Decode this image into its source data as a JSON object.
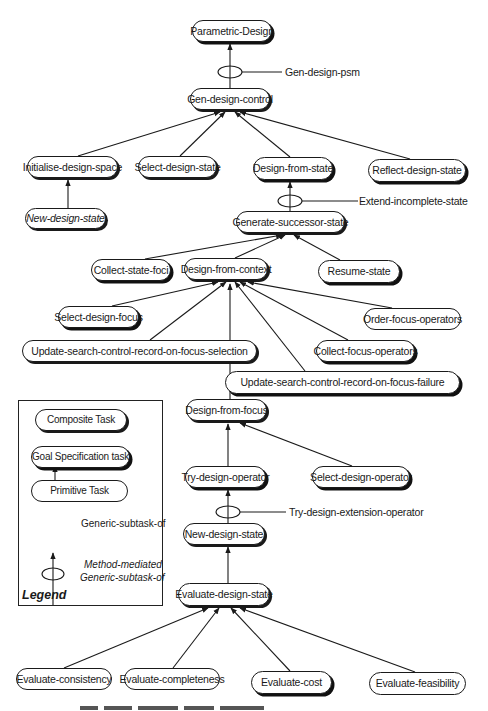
{
  "diagram": {
    "type": "task-decomposition-hierarchy",
    "nodes": {
      "parametric_design": {
        "label": "Parametric-Design",
        "kind": "goal"
      },
      "gen_design_control": {
        "label": "Gen-design-control",
        "kind": "composite"
      },
      "initialise_design_space": {
        "label": "Initialise-design-space",
        "kind": "composite"
      },
      "select_design_state": {
        "label": "Select-design-state",
        "kind": "composite"
      },
      "design_from_state": {
        "label": "Design-from-state",
        "kind": "goal"
      },
      "reflect_design_state": {
        "label": "Reflect-design-state",
        "kind": "goal"
      },
      "new_design_state_italic": {
        "label": "New-design-state",
        "kind": "composite",
        "italic": true
      },
      "generate_successor_state": {
        "label": "Generate-successor-state",
        "kind": "composite"
      },
      "collect_state_foci": {
        "label": "Collect-state-foci",
        "kind": "goal"
      },
      "design_from_context": {
        "label": "Design-from-context",
        "kind": "composite"
      },
      "resume_state": {
        "label": "Resume-state",
        "kind": "goal"
      },
      "select_design_focus": {
        "label": "Select-design-focus",
        "kind": "goal"
      },
      "order_focus_operators": {
        "label": "Order-focus-operators",
        "kind": "primitive"
      },
      "update_on_focus_selection": {
        "label": "Update-search-control-record-on-focus-selection",
        "kind": "composite"
      },
      "collect_focus_operators": {
        "label": "Collect-focus-operators",
        "kind": "goal"
      },
      "update_on_focus_failure": {
        "label": "Update-search-control-record-on-focus-failure",
        "kind": "goal"
      },
      "design_from_focus": {
        "label": "Design-from-focus",
        "kind": "composite"
      },
      "try_design_operator": {
        "label": "Try-design-operator",
        "kind": "goal"
      },
      "select_design_operator": {
        "label": "Select-design-operator",
        "kind": "goal"
      },
      "new_design_state": {
        "label": "New-design-state",
        "kind": "composite"
      },
      "evaluate_design_state": {
        "label": "Evaluate-design-state",
        "kind": "composite"
      },
      "evaluate_consistency": {
        "label": "Evaluate-consistency",
        "kind": "primitive"
      },
      "evaluate_completeness": {
        "label": "Evaluate-completeness",
        "kind": "primitive"
      },
      "evaluate_cost": {
        "label": "Evaluate-cost",
        "kind": "goal"
      },
      "evaluate_feasibility": {
        "label": "Evaluate-feasibility",
        "kind": "primitive"
      }
    },
    "methods": {
      "gen_design_psm": {
        "label": "Gen-design-psm"
      },
      "extend_incomplete_state": {
        "label": "Extend-incomplete-state"
      },
      "try_design_extension_operator": {
        "label": "Try-design-extension-operator"
      }
    },
    "edges": [
      {
        "from": "gen_design_control",
        "to": "parametric_design",
        "via": "Gen-design-psm"
      },
      {
        "from": "initialise_design_space",
        "to": "gen_design_control"
      },
      {
        "from": "select_design_state",
        "to": "gen_design_control"
      },
      {
        "from": "design_from_state",
        "to": "gen_design_control"
      },
      {
        "from": "reflect_design_state",
        "to": "gen_design_control"
      },
      {
        "from": "new_design_state_italic",
        "to": "initialise_design_space"
      },
      {
        "from": "generate_successor_state",
        "to": "design_from_state",
        "via": "Extend-incomplete-state"
      },
      {
        "from": "collect_state_foci",
        "to": "generate_successor_state"
      },
      {
        "from": "design_from_context",
        "to": "generate_successor_state"
      },
      {
        "from": "resume_state",
        "to": "generate_successor_state"
      },
      {
        "from": "select_design_focus",
        "to": "design_from_context"
      },
      {
        "from": "update_on_focus_selection",
        "to": "design_from_context"
      },
      {
        "from": "design_from_focus",
        "to": "design_from_context"
      },
      {
        "from": "update_on_focus_failure",
        "to": "design_from_context"
      },
      {
        "from": "collect_focus_operators",
        "to": "design_from_context"
      },
      {
        "from": "order_focus_operators",
        "to": "design_from_context"
      },
      {
        "from": "try_design_operator",
        "to": "design_from_focus"
      },
      {
        "from": "select_design_operator",
        "to": "design_from_focus"
      },
      {
        "from": "new_design_state",
        "to": "try_design_operator",
        "via": "Try-design-extension-operator"
      },
      {
        "from": "evaluate_design_state",
        "to": "new_design_state"
      },
      {
        "from": "evaluate_consistency",
        "to": "evaluate_design_state"
      },
      {
        "from": "evaluate_completeness",
        "to": "evaluate_design_state"
      },
      {
        "from": "evaluate_cost",
        "to": "evaluate_design_state"
      },
      {
        "from": "evaluate_feasibility",
        "to": "evaluate_design_state"
      }
    ]
  },
  "legend": {
    "title": "Legend",
    "composite": "Composite Task",
    "goal": "Goal Specification task",
    "primitive": "Primitive Task",
    "generic_subtask": "Generic-subtask-of",
    "method_mediated_line1": "Method-mediated",
    "method_mediated_line2": "Generic-subtask-of"
  },
  "colors": {
    "ink": "#1a1a1a",
    "background": "#ffffff"
  }
}
